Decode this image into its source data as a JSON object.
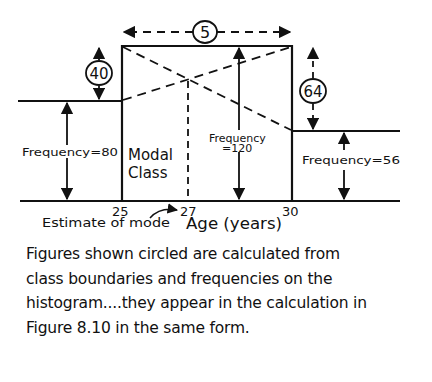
{
  "diagram": {
    "type": "histogram-mode-estimate",
    "x_axis": {
      "label": "Age (years)",
      "ticks": [
        "25",
        "27",
        "30"
      ]
    },
    "bars": [
      {
        "name": "pre-modal",
        "frequency_label": "Frequency=80",
        "frequency": 80
      },
      {
        "name": "modal",
        "label_line1": "Modal",
        "label_line2": "Class",
        "frequency_label_line1": "Frequency",
        "frequency_label_line2": "=120",
        "frequency": 120,
        "from": 25,
        "to": 30
      },
      {
        "name": "post-modal",
        "frequency_label": "Frequency=56",
        "frequency": 56
      }
    ],
    "circled_figures": {
      "class_width": "5",
      "diff_before": "40",
      "diff_after": "64"
    },
    "annotations": {
      "estimate_of_mode": "Estimate of mode",
      "mode_value": "27"
    },
    "colors": {
      "ink": "#111111",
      "background": "#ffffff"
    }
  },
  "caption": {
    "lines": [
      "Figures shown circled are calculated from",
      "class boundaries and frequencies on the",
      "histogram....they appear in the calculation in",
      "Figure 8.10 in the same form."
    ]
  }
}
